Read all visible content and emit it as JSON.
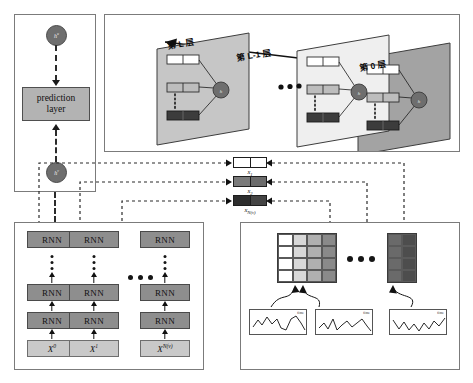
{
  "figure": {
    "type": "diagram"
  },
  "prediction_panel": {
    "name": "prediction-panel",
    "top_node": "h",
    "top_node_sup": "u",
    "box_line1": "prediction",
    "box_line2": "layer",
    "bottom_node": "h",
    "bottom_node_sup": "v"
  },
  "layers_panel": {
    "name": "layers-panel",
    "planes": [
      {
        "label": "第 L 层",
        "node": "h",
        "node_sup": "L"
      },
      {
        "label": "第 L-1 层",
        "node": "h",
        "node_sup": "L-1"
      },
      {
        "label": "第 0 层",
        "node": "h",
        "node_sup": "0"
      }
    ],
    "ellipsis": "•••",
    "flow_arrow_direction": "right-to-left"
  },
  "x_vectors": [
    {
      "label": "x",
      "sub": "1"
    },
    {
      "label": "x",
      "sub": "2"
    },
    {
      "label": "x",
      "sub": "N(v)"
    }
  ],
  "rnn_panel": {
    "name": "rnn-panel",
    "cell_label": "RNN",
    "columns": [
      {
        "input_label": "X",
        "input_sup": "0"
      },
      {
        "input_label": "X",
        "input_sup": "1"
      },
      {
        "input_label": "X",
        "input_sup": "N(v)"
      }
    ],
    "vertical_ellipsis": "⋮",
    "horizontal_ellipsis": "•••"
  },
  "matrix_panel": {
    "name": "matrix-panel",
    "ellipsis": "•••",
    "matrices": [
      {
        "rows": 4,
        "cols": 4,
        "shades": [
          "#ffffff",
          "#d8d8d8",
          "#b0b0b0",
          "#8a8a8a"
        ]
      },
      {
        "rows": 4,
        "cols": 2,
        "shades": [
          "#6a6a6a",
          "#4d4d4d"
        ]
      }
    ],
    "waveforms": [
      {
        "label": "time"
      },
      {
        "label": "time"
      },
      {
        "label": "time"
      }
    ]
  },
  "colors": {
    "panel_border": "#7b7b7b",
    "node_fill": "#6e6e6e",
    "rnn_fill": "#8e8e8e",
    "input_fill": "#c9c9c9",
    "prediction_fill": "#b3b3b3",
    "plane_light": "#efefef",
    "plane_mid": "#c6c6c6",
    "plane_dark": "#a3a3a3",
    "dashed_line": "#2b2b2b"
  }
}
